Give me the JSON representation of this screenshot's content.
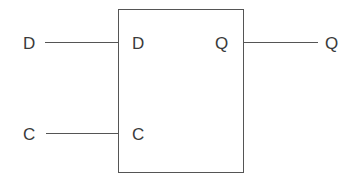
{
  "diagram": {
    "type": "d-latch-block",
    "inputs": [
      {
        "external_label": "D",
        "pin_label": "D"
      },
      {
        "external_label": "C",
        "pin_label": "C"
      }
    ],
    "outputs": [
      {
        "external_label": "Q",
        "pin_label": "Q"
      }
    ]
  }
}
